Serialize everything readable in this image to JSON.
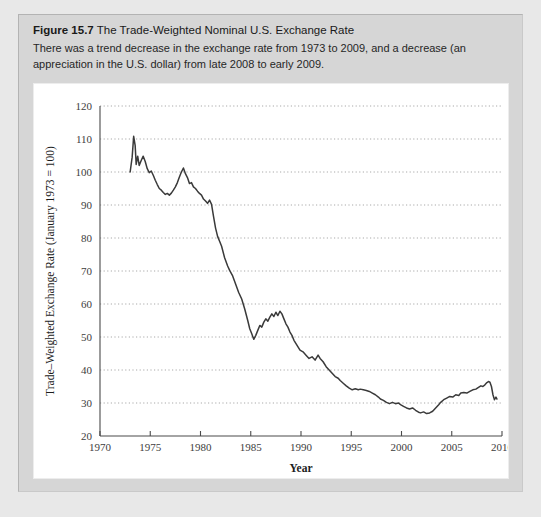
{
  "figure": {
    "label": "Figure 15.7",
    "title": "The Trade-Weighted Nominal U.S. Exchange Rate",
    "description": "There was a trend decrease in the exchange rate from 1973 to 2009, and a decrease (an appreciation in the U.S. dollar) from late 2008 to early 2009."
  },
  "chart_data": {
    "type": "line",
    "title": "The Trade-Weighted Nominal U.S. Exchange Rate",
    "xlabel": "Year",
    "ylabel": "Trade–Weighted Exchange Rate (January 1973 = 100)",
    "xlim": [
      1970,
      2010
    ],
    "ylim": [
      20,
      120
    ],
    "xticks": [
      1970,
      1975,
      1980,
      1985,
      1990,
      1995,
      2000,
      2005,
      2010
    ],
    "yticks": [
      20,
      30,
      40,
      50,
      60,
      70,
      80,
      90,
      100,
      110,
      120
    ],
    "grid": "horizontal-dotted",
    "legend": "none",
    "line_color": "#3a3a3a",
    "series": [
      {
        "name": "Trade-Weighted Nominal U.S. Exchange Rate",
        "x": [
          1973.0,
          1973.2,
          1973.35,
          1973.5,
          1973.6,
          1973.75,
          1973.9,
          1974.1,
          1974.3,
          1974.5,
          1974.7,
          1974.9,
          1975.1,
          1975.3,
          1975.5,
          1975.7,
          1975.9,
          1976.1,
          1976.3,
          1976.5,
          1976.7,
          1976.9,
          1977.1,
          1977.3,
          1977.5,
          1977.7,
          1977.9,
          1978.1,
          1978.3,
          1978.5,
          1978.7,
          1978.9,
          1979.1,
          1979.3,
          1979.5,
          1979.7,
          1979.9,
          1980.1,
          1980.3,
          1980.5,
          1980.7,
          1980.9,
          1981.1,
          1981.3,
          1981.5,
          1981.7,
          1981.9,
          1982.1,
          1982.4,
          1982.7,
          1982.9,
          1983.2,
          1983.5,
          1983.8,
          1984.1,
          1984.4,
          1984.7,
          1984.9,
          1985.1,
          1985.3,
          1985.5,
          1985.7,
          1985.9,
          1986.1,
          1986.3,
          1986.5,
          1986.7,
          1986.9,
          1987.1,
          1987.3,
          1987.5,
          1987.7,
          1987.9,
          1988.1,
          1988.3,
          1988.5,
          1988.7,
          1988.9,
          1989.1,
          1989.3,
          1989.5,
          1989.7,
          1989.9,
          1990.2,
          1990.5,
          1990.8,
          1991.1,
          1991.4,
          1991.7,
          1991.9,
          1992.2,
          1992.5,
          1992.8,
          1993.1,
          1993.4,
          1993.7,
          1993.9,
          1994.2,
          1994.5,
          1994.8,
          1995.1,
          1995.4,
          1995.7,
          1995.9,
          1996.2,
          1996.5,
          1996.8,
          1997.1,
          1997.4,
          1997.7,
          1997.9,
          1998.2,
          1998.5,
          1998.8,
          1999.1,
          1999.4,
          1999.7,
          1999.9,
          2000.2,
          2000.5,
          2000.8,
          2001.1,
          2001.4,
          2001.7,
          2001.9,
          2002.2,
          2002.5,
          2002.8,
          2003.1,
          2003.4,
          2003.7,
          2003.9,
          2004.2,
          2004.5,
          2004.8,
          2005.1,
          2005.4,
          2005.7,
          2005.9,
          2006.2,
          2006.5,
          2006.8,
          2007.1,
          2007.4,
          2007.7,
          2007.9,
          2008.1,
          2008.3,
          2008.5,
          2008.65,
          2008.8,
          2008.95,
          2009.1,
          2009.25,
          2009.4,
          2009.5
        ],
        "y": [
          100.0,
          104.5,
          110.8,
          108.0,
          102.3,
          104.8,
          102.0,
          103.5,
          104.8,
          103.2,
          101.0,
          99.8,
          100.3,
          99.0,
          97.5,
          96.2,
          95.0,
          94.5,
          93.8,
          93.2,
          93.5,
          93.0,
          93.6,
          94.5,
          95.5,
          96.8,
          98.5,
          100.0,
          101.2,
          99.5,
          98.3,
          96.5,
          96.8,
          95.5,
          95.0,
          94.2,
          93.5,
          93.0,
          91.8,
          91.2,
          90.5,
          91.5,
          90.2,
          86.5,
          83.0,
          80.5,
          79.0,
          77.5,
          74.0,
          71.5,
          70.2,
          68.5,
          66.0,
          63.5,
          61.5,
          58.5,
          55.0,
          52.5,
          51.0,
          49.3,
          50.5,
          52.0,
          53.5,
          53.0,
          54.5,
          55.5,
          54.8,
          56.0,
          57.0,
          56.2,
          57.5,
          56.5,
          57.8,
          57.0,
          55.5,
          54.0,
          53.0,
          51.5,
          50.5,
          49.0,
          48.0,
          47.0,
          46.0,
          45.5,
          44.5,
          43.5,
          44.0,
          43.0,
          44.5,
          43.5,
          42.5,
          41.0,
          40.0,
          39.0,
          38.0,
          37.5,
          36.8,
          36.0,
          35.2,
          34.5,
          34.0,
          34.3,
          34.0,
          34.2,
          34.0,
          33.8,
          33.5,
          33.0,
          32.5,
          31.8,
          31.2,
          30.8,
          30.2,
          29.8,
          30.2,
          29.8,
          30.0,
          29.5,
          29.0,
          28.5,
          28.2,
          28.5,
          27.8,
          27.2,
          27.0,
          27.3,
          26.8,
          27.0,
          27.5,
          28.5,
          29.5,
          30.2,
          31.0,
          31.5,
          32.0,
          31.8,
          32.5,
          32.3,
          33.0,
          33.2,
          33.0,
          33.5,
          34.0,
          34.2,
          34.8,
          35.2,
          35.0,
          35.5,
          36.2,
          36.5,
          36.3,
          35.0,
          32.5,
          31.0,
          31.8,
          31.2
        ]
      }
    ]
  }
}
